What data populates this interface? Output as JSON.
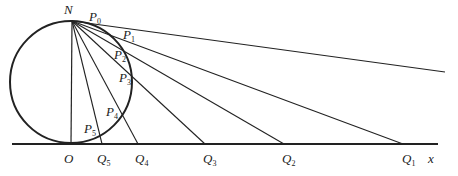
{
  "diagram": {
    "colors": {
      "stroke": "#222222",
      "background": "#ffffff"
    },
    "circle": {
      "cx": 71,
      "cy": 82,
      "r": 61
    },
    "axis": {
      "x1": 12,
      "x2": 438,
      "y": 144,
      "label": "x"
    },
    "north": {
      "x": 72,
      "y": 21,
      "label": "N"
    },
    "origin": {
      "x": 71,
      "y": 144,
      "label": "O"
    },
    "rays": [
      {
        "name": "P0",
        "end_x": 445,
        "end_y": 72
      },
      {
        "name": "Q1",
        "end_x": 403,
        "end_y": 144
      },
      {
        "name": "Q2",
        "end_x": 284,
        "end_y": 144
      },
      {
        "name": "Q3",
        "end_x": 205,
        "end_y": 144
      },
      {
        "name": "Q4",
        "end_x": 138,
        "end_y": 144
      },
      {
        "name": "Q5",
        "end_x": 102,
        "end_y": 144
      }
    ],
    "point_labels": [
      {
        "base": "P",
        "sub": "0",
        "x": 89,
        "y": 21
      },
      {
        "base": "P",
        "sub": "1",
        "x": 123,
        "y": 39
      },
      {
        "base": "P",
        "sub": "2",
        "x": 114,
        "y": 59
      },
      {
        "base": "P",
        "sub": "3",
        "x": 119,
        "y": 82
      },
      {
        "base": "P",
        "sub": "4",
        "x": 106,
        "y": 116
      },
      {
        "base": "P",
        "sub": "5",
        "x": 84,
        "y": 133
      }
    ],
    "axis_labels": [
      {
        "base": "O",
        "sub": "",
        "x": 64,
        "y": 163
      },
      {
        "base": "Q",
        "sub": "5",
        "x": 97,
        "y": 163
      },
      {
        "base": "Q",
        "sub": "4",
        "x": 135,
        "y": 163
      },
      {
        "base": "Q",
        "sub": "3",
        "x": 203,
        "y": 163
      },
      {
        "base": "Q",
        "sub": "2",
        "x": 282,
        "y": 163
      },
      {
        "base": "Q",
        "sub": "1",
        "x": 402,
        "y": 163
      },
      {
        "base": "x",
        "sub": "",
        "x": 428,
        "y": 163
      }
    ],
    "labels": {
      "N": "N",
      "O": "O",
      "x": "x",
      "P0": "P0",
      "P1": "P1",
      "P2": "P2",
      "P3": "P3",
      "P4": "P4",
      "P5": "P5",
      "Q1": "Q1",
      "Q2": "Q2",
      "Q3": "Q3",
      "Q4": "Q4",
      "Q5": "Q5"
    }
  }
}
